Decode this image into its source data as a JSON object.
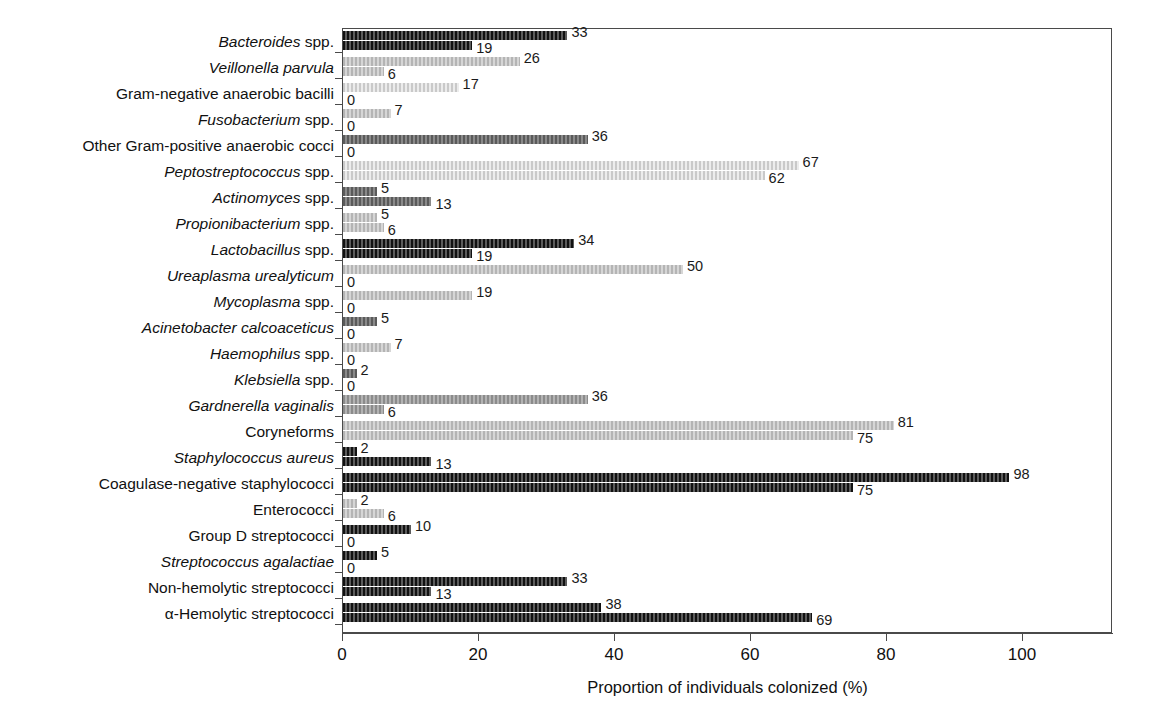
{
  "chart_data": {
    "type": "bar",
    "orientation": "horizontal",
    "title": "",
    "xlabel": "Proportion of individuals colonized (%)",
    "ylabel": "",
    "xlim": [
      0,
      113
    ],
    "xticks": [
      0,
      20,
      40,
      60,
      80,
      100
    ],
    "xtick_labels": [
      "0",
      "20",
      "40",
      "60",
      "80",
      "100"
    ],
    "grid": false,
    "legend": false,
    "categories": [
      "Bacteroides spp.",
      "Veillonella parvula",
      "Gram-negative anaerobic bacilli",
      "Fusobacterium spp.",
      "Other Gram-positive anaerobic cocci",
      "Peptostreptococcus spp.",
      "Actinomyces spp.",
      "Propionibacterium spp.",
      "Lactobacillus spp.",
      "Ureaplasma urealyticum",
      "Mycoplasma spp.",
      "Acinetobacter calcoaceticus",
      "Haemophilus spp.",
      "Klebsiella spp.",
      "Gardnerella vaginalis",
      "Coryneforms",
      "Staphylococcus aureus",
      "Coagulase-negative staphylococci",
      "Enterococci",
      "Group D streptococci",
      "Streptococcus agalactiae",
      "Non-hemolytic streptococci",
      "α-Hemolytic streptococci"
    ],
    "series": [
      {
        "name": "upper",
        "values": [
          33,
          26,
          17,
          7,
          36,
          67,
          5,
          5,
          34,
          50,
          19,
          5,
          7,
          2,
          36,
          81,
          2,
          98,
          2,
          10,
          5,
          33,
          38
        ]
      },
      {
        "name": "lower",
        "values": [
          19,
          6,
          0,
          0,
          0,
          62,
          13,
          6,
          19,
          0,
          0,
          0,
          0,
          0,
          6,
          75,
          13,
          75,
          6,
          0,
          0,
          13,
          69
        ]
      }
    ]
  },
  "rows": [
    {
      "label_italic": "Bacteroides",
      "label_roman": " spp.",
      "upper": 33,
      "lower": 19,
      "fill": "fill-k"
    },
    {
      "label_italic": "Veillonella parvula",
      "label_roman": "",
      "upper": 26,
      "lower": 6,
      "fill": "fill-l"
    },
    {
      "label_italic": "",
      "label_roman": "Gram-negative anaerobic bacilli",
      "upper": 17,
      "lower": 0,
      "fill": "fill-xl"
    },
    {
      "label_italic": "Fusobacterium",
      "label_roman": " spp.",
      "upper": 7,
      "lower": 0,
      "fill": "fill-l"
    },
    {
      "label_italic": "",
      "label_roman": "Other Gram-positive anaerobic cocci",
      "upper": 36,
      "lower": 0,
      "fill": "fill-d"
    },
    {
      "label_italic": "Peptostreptococcus",
      "label_roman": " spp.",
      "upper": 67,
      "lower": 62,
      "fill": "fill-xl"
    },
    {
      "label_italic": "Actinomyces",
      "label_roman": " spp.",
      "upper": 5,
      "lower": 13,
      "fill": "fill-d"
    },
    {
      "label_italic": "Propionibacterium",
      "label_roman": " spp.",
      "upper": 5,
      "lower": 6,
      "fill": "fill-l"
    },
    {
      "label_italic": "Lactobacillus",
      "label_roman": " spp.",
      "upper": 34,
      "lower": 19,
      "fill": "fill-k"
    },
    {
      "label_italic": "Ureaplasma urealyticum",
      "label_roman": "",
      "upper": 50,
      "lower": 0,
      "fill": "fill-l"
    },
    {
      "label_italic": "Mycoplasma",
      "label_roman": " spp.",
      "upper": 19,
      "lower": 0,
      "fill": "fill-l"
    },
    {
      "label_italic": "Acinetobacter calcoaceticus",
      "label_roman": "",
      "upper": 5,
      "lower": 0,
      "fill": "fill-d"
    },
    {
      "label_italic": "Haemophilus",
      "label_roman": " spp.",
      "upper": 7,
      "lower": 0,
      "fill": "fill-l"
    },
    {
      "label_italic": "Klebsiella",
      "label_roman": " spp.",
      "upper": 2,
      "lower": 0,
      "fill": "fill-d"
    },
    {
      "label_italic": "Gardnerella vaginalis",
      "label_roman": "",
      "upper": 36,
      "lower": 6,
      "fill": "fill-m"
    },
    {
      "label_italic": "",
      "label_roman": "Coryneforms",
      "upper": 81,
      "lower": 75,
      "fill": "fill-l"
    },
    {
      "label_italic": "Staphylococcus aureus",
      "label_roman": "",
      "upper": 2,
      "lower": 13,
      "fill": "fill-k"
    },
    {
      "label_italic": "",
      "label_roman": "Coagulase-negative staphylococci",
      "upper": 98,
      "lower": 75,
      "fill": "fill-k"
    },
    {
      "label_italic": "",
      "label_roman": "Enterococci",
      "upper": 2,
      "lower": 6,
      "fill": "fill-l"
    },
    {
      "label_italic": "",
      "label_roman": "Group D streptococci",
      "upper": 10,
      "lower": 0,
      "fill": "fill-k"
    },
    {
      "label_italic": "Streptococcus agalactiae",
      "label_roman": "",
      "upper": 5,
      "lower": 0,
      "fill": "fill-k"
    },
    {
      "label_italic": "",
      "label_roman": "Non-hemolytic streptococci",
      "upper": 33,
      "lower": 13,
      "fill": "fill-k"
    },
    {
      "label_italic": "",
      "label_roman": "α-Hemolytic streptococci",
      "upper": 38,
      "lower": 69,
      "fill": "fill-k"
    }
  ],
  "axis": {
    "x_title": "Proportion of individuals colonized (%)",
    "x_tick_labels": [
      "0",
      "20",
      "40",
      "60",
      "80",
      "100"
    ],
    "x_tick_values": [
      0,
      20,
      40,
      60,
      80,
      100
    ]
  },
  "colors": {
    "frame": "#4a4a4a",
    "text": "#111111",
    "bar_dark": "#2b2b2b",
    "bar_mid": "#9a9a9a",
    "bar_light": "#c2c2c2"
  }
}
